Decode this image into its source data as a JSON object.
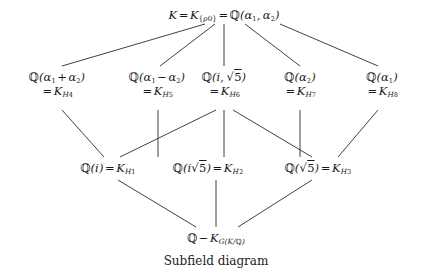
{
  "diagram": {
    "caption": "Subfield diagram",
    "ink_color": "#1a1a1a",
    "background_color": "#ffffff",
    "nodes": {
      "top": {
        "name": "K",
        "text": "K = K_{ρ0} = ℚ(α1, α2)",
        "field_symbol": "K",
        "eq1": "=",
        "k_label": "K",
        "subscript_set": "{ρ0}",
        "eq2": "=",
        "base": "ℚ",
        "generators": "(α1, α2)"
      },
      "h4": {
        "line1": "ℚ(α1 + α2)",
        "line2": "= K_{H4}",
        "field": "ℚ(α1 + α2)",
        "subgroup": "H4"
      },
      "h5": {
        "line1": "ℚ(α1 − α2)",
        "line2": "= K_{H5}",
        "field": "ℚ(α1 − α2)",
        "subgroup": "H5"
      },
      "h6": {
        "line1": "ℚ(i, √5)",
        "line2": "= K_{H6}",
        "field": "ℚ(i, √5)",
        "subgroup": "H6"
      },
      "h7": {
        "line1": "ℚ(α2)",
        "line2": "= K_{H7}",
        "field": "ℚ(α2)",
        "subgroup": "H7"
      },
      "h8": {
        "line1": "ℚ(α1)",
        "line2": "= K_{H8}",
        "field": "ℚ(α1)",
        "subgroup": "H8"
      },
      "h1": {
        "text": "ℚ(i) = K_{H1}",
        "field": "ℚ(i)",
        "subgroup": "H1"
      },
      "h2": {
        "text": "ℚ(i√5) = K_{H2}",
        "field": "ℚ(i√5)",
        "subgroup": "H2"
      },
      "h3": {
        "text": "ℚ(√5) = K_{H3}",
        "field": "ℚ(√5)",
        "subgroup": "H3"
      },
      "bottom": {
        "text": "ℚ − K_{G(K/ℚ)}",
        "field": "ℚ",
        "separator": "−",
        "subgroup": "G(K/ℚ)"
      }
    }
  }
}
